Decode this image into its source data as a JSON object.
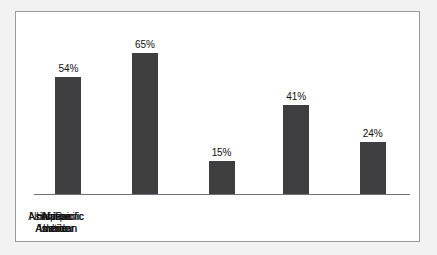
{
  "chart_data": {
    "type": "bar",
    "title": "",
    "subtitle": "",
    "xlabel": "",
    "ylabel": "",
    "ylim": [
      0,
      70
    ],
    "grid": false,
    "legend": null,
    "categories": [
      "Native American",
      "African American",
      "Asian/Pacific Islander",
      "Hispanic/ Latino",
      "Nonhispanic white"
    ],
    "category_lines": [
      [
        "Native",
        "American"
      ],
      [
        "African",
        "American"
      ],
      [
        "Asian/Pacific",
        "Islander"
      ],
      [
        "Hispanic/",
        "Latino"
      ],
      [
        "Nonhispanic",
        "white"
      ]
    ],
    "values": [
      54,
      65,
      15,
      41,
      24
    ],
    "value_labels": [
      "54%",
      "65%",
      "15%",
      "41%",
      "24%"
    ],
    "bar_color": "#3f3f42",
    "axis_color": "#6f6f7a",
    "frame_color": "#9a9a9a",
    "plot_background": "#ffffff",
    "page_background": "#f2f2f2"
  }
}
